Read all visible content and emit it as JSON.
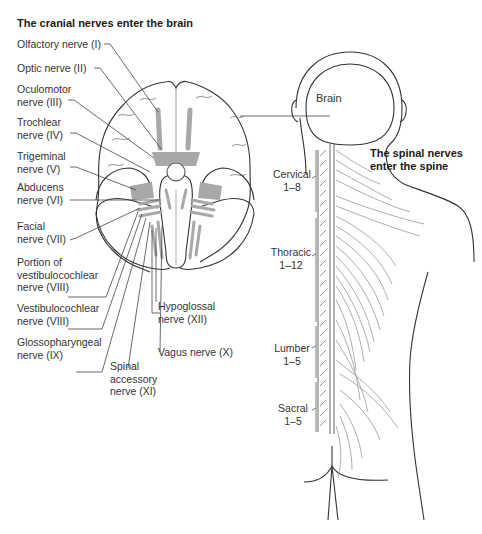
{
  "left_panel": {
    "title": "The cranial nerves enter the brain",
    "labels": [
      {
        "id": "olfactory",
        "line1": "Olfactory nerve (I)"
      },
      {
        "id": "optic",
        "line1": "Optic nerve (II)"
      },
      {
        "id": "oculomotor",
        "line1": "Oculomotor",
        "line2": "nerve (III)"
      },
      {
        "id": "trochlear",
        "line1": "Trochlear",
        "line2": "nerve (IV)"
      },
      {
        "id": "trigeminal",
        "line1": "Trigeminal",
        "line2": "nerve (V)"
      },
      {
        "id": "abducens",
        "line1": "Abducens",
        "line2": "nerve (VI)"
      },
      {
        "id": "facial",
        "line1": "Facial",
        "line2": "nerve (VII)"
      },
      {
        "id": "vestibulocochlear_portion",
        "line1": "Portion of",
        "line2": "vestibulocochlear",
        "line3": "nerve (VIII)"
      },
      {
        "id": "vestibulocochlear",
        "line1": "Vestibulocochlear",
        "line2": "nerve (VIII)"
      },
      {
        "id": "glossopharyngeal",
        "line1": "Glossopharyngeal",
        "line2": "nerve (IX)"
      },
      {
        "id": "spinal_accessory",
        "line1": "Spinal",
        "line2": "accessory",
        "line3": "nerve (XI)"
      },
      {
        "id": "vagus",
        "line1": "Vagus nerve (X)"
      },
      {
        "id": "hypoglossal",
        "line1": "Hypoglossal",
        "line2": "nerve (XII)"
      }
    ]
  },
  "right_panel": {
    "title_line1": "The spinal nerves",
    "title_line2": "enter the spine",
    "brain_label": "Brain",
    "regions": [
      {
        "name": "Cervical",
        "range": "1–8"
      },
      {
        "name": "Thoracic",
        "range": "1–12"
      },
      {
        "name": "Lumber",
        "range": "1–5"
      },
      {
        "name": "Sacral",
        "range": "1–5"
      }
    ]
  },
  "colors": {
    "outline": "#333333",
    "nerve_fill": "#a8a8a8",
    "leader": "#444444",
    "fine": "#9a9a9a"
  }
}
